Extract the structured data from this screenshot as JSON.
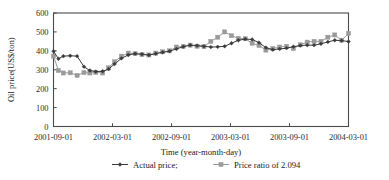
{
  "chart_data": {
    "type": "line",
    "title": "",
    "xlabel": "Time (year-month-day)",
    "ylabel": "Oil price(US$/ton)",
    "ylim": [
      0,
      600
    ],
    "yticks": [
      0,
      100,
      200,
      300,
      400,
      500,
      600
    ],
    "ytick_labels": [
      "0",
      "100",
      "200",
      "300",
      "400",
      "500",
      "600"
    ],
    "xtick_labels": [
      "2001-09-01",
      "2002-03-01",
      "2002-09-01",
      "2003-03-01",
      "2003-09-01",
      "2004-03-01"
    ],
    "xtick_positions_months": [
      0,
      6,
      12,
      18,
      24,
      30
    ],
    "xlim_months": [
      0,
      30
    ],
    "grid": false,
    "legend_position": "below-axis",
    "series": [
      {
        "name": "Actual price;",
        "color": "#3a3a3a",
        "marker": "diamond",
        "x_months": [
          0.0,
          0.5,
          1.0,
          1.7,
          2.4,
          3.1,
          3.7,
          4.3,
          5.0,
          5.6,
          6.2,
          6.9,
          7.6,
          8.3,
          9.0,
          9.7,
          10.4,
          11.1,
          11.8,
          12.5,
          13.2,
          13.9,
          14.6,
          15.3,
          16.0,
          16.7,
          17.4,
          18.1,
          18.8,
          19.5,
          20.2,
          20.9,
          21.6,
          22.3,
          23.0,
          23.7,
          24.4,
          25.1,
          25.8,
          26.5,
          27.2,
          27.9,
          28.6,
          29.3,
          30.0
        ],
        "values": [
          398,
          358,
          372,
          374,
          372,
          316,
          296,
          290,
          292,
          303,
          330,
          360,
          378,
          385,
          382,
          378,
          385,
          392,
          398,
          410,
          422,
          430,
          428,
          424,
          420,
          421,
          424,
          440,
          456,
          462,
          460,
          443,
          417,
          406,
          410,
          414,
          422,
          428,
          430,
          430,
          437,
          447,
          456,
          454,
          449
        ]
      },
      {
        "name": "Price ratio of 2.094",
        "color": "#9a9a9a",
        "marker": "square",
        "x_months": [
          0.0,
          0.5,
          1.0,
          1.7,
          2.4,
          3.1,
          3.7,
          4.3,
          5.0,
          5.6,
          6.2,
          6.9,
          7.6,
          8.3,
          9.0,
          9.7,
          10.4,
          11.1,
          11.8,
          12.5,
          13.2,
          13.9,
          14.6,
          15.3,
          16.0,
          16.7,
          17.4,
          18.1,
          18.8,
          19.5,
          20.2,
          20.9,
          21.6,
          22.3,
          23.0,
          23.7,
          24.4,
          25.1,
          25.8,
          26.5,
          27.2,
          27.9,
          28.6,
          29.3,
          30.0
        ],
        "values": [
          372,
          296,
          283,
          284,
          270,
          285,
          283,
          286,
          283,
          310,
          342,
          372,
          388,
          385,
          380,
          378,
          388,
          395,
          400,
          420,
          423,
          430,
          424,
          422,
          450,
          472,
          500,
          480,
          466,
          464,
          440,
          428,
          404,
          412,
          420,
          424,
          412,
          432,
          446,
          450,
          450,
          472,
          484,
          456,
          492
        ]
      }
    ]
  }
}
